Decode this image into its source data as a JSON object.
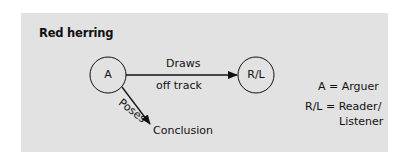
{
  "title": "Red herring",
  "nodes": {
    "arguer": {
      "label": "A"
    },
    "reader": {
      "label": "R/L"
    }
  },
  "edges": {
    "draws": {
      "line1": "Draws",
      "line2": "off track"
    },
    "poses": {
      "label": "Poses",
      "target": "Conclusion"
    }
  },
  "legend": {
    "row1": {
      "key": "A =",
      "value": "Arguer"
    },
    "row2": {
      "key": "R/L =",
      "value": "Reader/",
      "value2": "Listener"
    }
  },
  "colors": {
    "panel": "#e2e2e2",
    "stroke": "#111111"
  }
}
